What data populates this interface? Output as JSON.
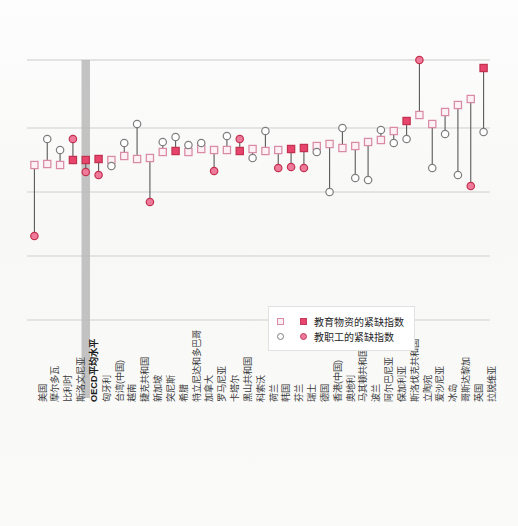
{
  "chart_data": {
    "type": "scatter",
    "title": "",
    "subtitle": "",
    "xlabel": "",
    "ylabel": "",
    "grid": true,
    "legend_position": "inside-bottom-center",
    "axis": {
      "y_gridlines_px": [
        60,
        128,
        192,
        256,
        320
      ],
      "plot_left_px": 28,
      "plot_right_px": 490,
      "plot_top_px": 60,
      "plot_bottom_px": 398
    },
    "highlight_category": "OECD平均水平",
    "series": [
      {
        "name": "教育物资的紧缺指数",
        "marker": "square",
        "color_open": "#d98ba6",
        "color_fill": "#e8456e"
      },
      {
        "name": "教职工的紧缺指数",
        "marker": "circle",
        "color_open": "#7e7e7e",
        "color_fill": "#ef7a9b"
      }
    ],
    "categories": [
      "美国",
      "摩尔多瓦",
      "比利时",
      "斯洛文尼亚",
      "OECD平均水平",
      "匈牙利",
      "台湾(中国)",
      "越南",
      "捷克共和国",
      "新加坡",
      "突尼斯",
      "希腊",
      "特立尼达和多巴哥",
      "加拿大",
      "罗马尼亚",
      "卡塔尔",
      "黑山共和国",
      "科索沃",
      "荷兰",
      "韩国",
      "芬兰",
      "瑞士",
      "德国",
      "香港(中国)",
      "奥地利",
      "马其顿共和国",
      "波兰",
      "阿尔巴尼亚",
      "保加利亚",
      "斯洛伐克共和国",
      "立陶宛",
      "爱沙尼亚",
      "冰岛",
      "哥斯达黎加",
      "英国",
      "拉脱维亚"
    ],
    "points": [
      {
        "cat": "美国",
        "sq_y": 165,
        "sq_filled": false,
        "ci_y": 236,
        "ci_filled": true
      },
      {
        "cat": "摩尔多瓦",
        "sq_y": 164,
        "sq_filled": false,
        "ci_y": 139,
        "ci_filled": false
      },
      {
        "cat": "比利时",
        "sq_y": 165,
        "sq_filled": false,
        "ci_y": 150,
        "ci_filled": false
      },
      {
        "cat": "斯洛文尼亚",
        "sq_y": 160,
        "sq_filled": true,
        "ci_y": 139,
        "ci_filled": true
      },
      {
        "cat": "OECD平均水平",
        "sq_y": 160,
        "sq_filled": true,
        "ci_y": 172,
        "ci_filled": true
      },
      {
        "cat": "匈牙利",
        "sq_y": 159,
        "sq_filled": true,
        "ci_y": 175,
        "ci_filled": true
      },
      {
        "cat": "台湾(中国)",
        "sq_y": 160,
        "sq_filled": false,
        "ci_y": 166,
        "ci_filled": false
      },
      {
        "cat": "越南",
        "sq_y": 156,
        "sq_filled": false,
        "ci_y": 143,
        "ci_filled": false
      },
      {
        "cat": "捷克共和国",
        "sq_y": 159,
        "sq_filled": false,
        "ci_y": 124,
        "ci_filled": false
      },
      {
        "cat": "新加坡",
        "sq_y": 158,
        "sq_filled": false,
        "ci_y": 202,
        "ci_filled": true
      },
      {
        "cat": "突尼斯",
        "sq_y": 152,
        "sq_filled": false,
        "ci_y": 142,
        "ci_filled": false
      },
      {
        "cat": "希腊",
        "sq_y": 151,
        "sq_filled": true,
        "ci_y": 137,
        "ci_filled": false
      },
      {
        "cat": "特立尼达和多巴哥",
        "sq_y": 152,
        "sq_filled": false,
        "ci_y": 145,
        "ci_filled": false
      },
      {
        "cat": "加拿大",
        "sq_y": 149,
        "sq_filled": false,
        "ci_y": 143,
        "ci_filled": false
      },
      {
        "cat": "罗马尼亚",
        "sq_y": 150,
        "sq_filled": false,
        "ci_y": 171,
        "ci_filled": true
      },
      {
        "cat": "卡塔尔",
        "sq_y": 150,
        "sq_filled": false,
        "ci_y": 136,
        "ci_filled": false
      },
      {
        "cat": "黑山共和国",
        "sq_y": 151,
        "sq_filled": true,
        "ci_y": 139,
        "ci_filled": true
      },
      {
        "cat": "科索沃",
        "sq_y": 149,
        "sq_filled": false,
        "ci_y": 158,
        "ci_filled": false
      },
      {
        "cat": "荷兰",
        "sq_y": 151,
        "sq_filled": false,
        "ci_y": 131,
        "ci_filled": false
      },
      {
        "cat": "韩国",
        "sq_y": 150,
        "sq_filled": false,
        "ci_y": 168,
        "ci_filled": true
      },
      {
        "cat": "芬兰",
        "sq_y": 149,
        "sq_filled": true,
        "ci_y": 167,
        "ci_filled": true
      },
      {
        "cat": "瑞士",
        "sq_y": 148,
        "sq_filled": true,
        "ci_y": 168,
        "ci_filled": true
      },
      {
        "cat": "德国",
        "sq_y": 146,
        "sq_filled": false,
        "ci_y": 152,
        "ci_filled": false
      },
      {
        "cat": "香港(中国)",
        "sq_y": 144,
        "sq_filled": false,
        "ci_y": 192,
        "ci_filled": false
      },
      {
        "cat": "奥地利",
        "sq_y": 148,
        "sq_filled": false,
        "ci_y": 128,
        "ci_filled": false
      },
      {
        "cat": "马其顿共和国",
        "sq_y": 146,
        "sq_filled": false,
        "ci_y": 178,
        "ci_filled": false
      },
      {
        "cat": "波兰",
        "sq_y": 142,
        "sq_filled": false,
        "ci_y": 180,
        "ci_filled": false
      },
      {
        "cat": "阿尔巴尼亚",
        "sq_y": 140,
        "sq_filled": false,
        "ci_y": 130,
        "ci_filled": false
      },
      {
        "cat": "保加利亚",
        "sq_y": 131,
        "sq_filled": false,
        "ci_y": 143,
        "ci_filled": false
      },
      {
        "cat": "斯洛伐克共和国",
        "sq_y": 121,
        "sq_filled": true,
        "ci_y": 139,
        "ci_filled": false
      },
      {
        "cat": "立陶宛",
        "sq_y": 115,
        "sq_filled": false,
        "ci_y": 60,
        "ci_filled": true
      },
      {
        "cat": "爱沙尼亚",
        "sq_y": 124,
        "sq_filled": false,
        "ci_y": 168,
        "ci_filled": false
      },
      {
        "cat": "冰岛",
        "sq_y": 112,
        "sq_filled": false,
        "ci_y": 134,
        "ci_filled": false
      },
      {
        "cat": "哥斯达黎加",
        "sq_y": 105,
        "sq_filled": false,
        "ci_y": 175,
        "ci_filled": false
      },
      {
        "cat": "英国",
        "sq_y": 99,
        "sq_filled": false,
        "ci_y": 186,
        "ci_filled": true
      },
      {
        "cat": "拉脱维亚",
        "sq_y": 68,
        "sq_filled": true,
        "ci_y": 132,
        "ci_filled": false
      }
    ]
  },
  "legend": {
    "items": [
      {
        "label": "教育物资的紧缺指数",
        "marker": "square"
      },
      {
        "label": "教职工的紧缺指数",
        "marker": "circle"
      }
    ]
  },
  "colors": {
    "accent_pink": "#e8456e",
    "accent_pink_light": "#ef7a9b",
    "square_open_stroke": "#d98ba6",
    "circle_open_stroke": "#7e7e7e",
    "gridline": "#c9c9c9",
    "connector": "#5a5a5a",
    "highlight_band": "#b9b9b9"
  }
}
